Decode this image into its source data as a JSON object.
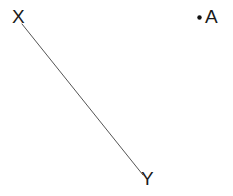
{
  "figure": {
    "width": 233,
    "height": 196,
    "background_color": "#ffffff",
    "ink_color": "#1a1a1a",
    "line_color": "#555555",
    "segment": {
      "name": "XY",
      "x1": 22,
      "y1": 24,
      "x2": 143,
      "y2": 175,
      "stroke_width": 1
    },
    "point_marker": {
      "name": "A",
      "cx": 199.5,
      "cy": 17.5,
      "r": 2.2
    },
    "labels": {
      "x": "X",
      "y": "Y",
      "a": "A"
    }
  }
}
